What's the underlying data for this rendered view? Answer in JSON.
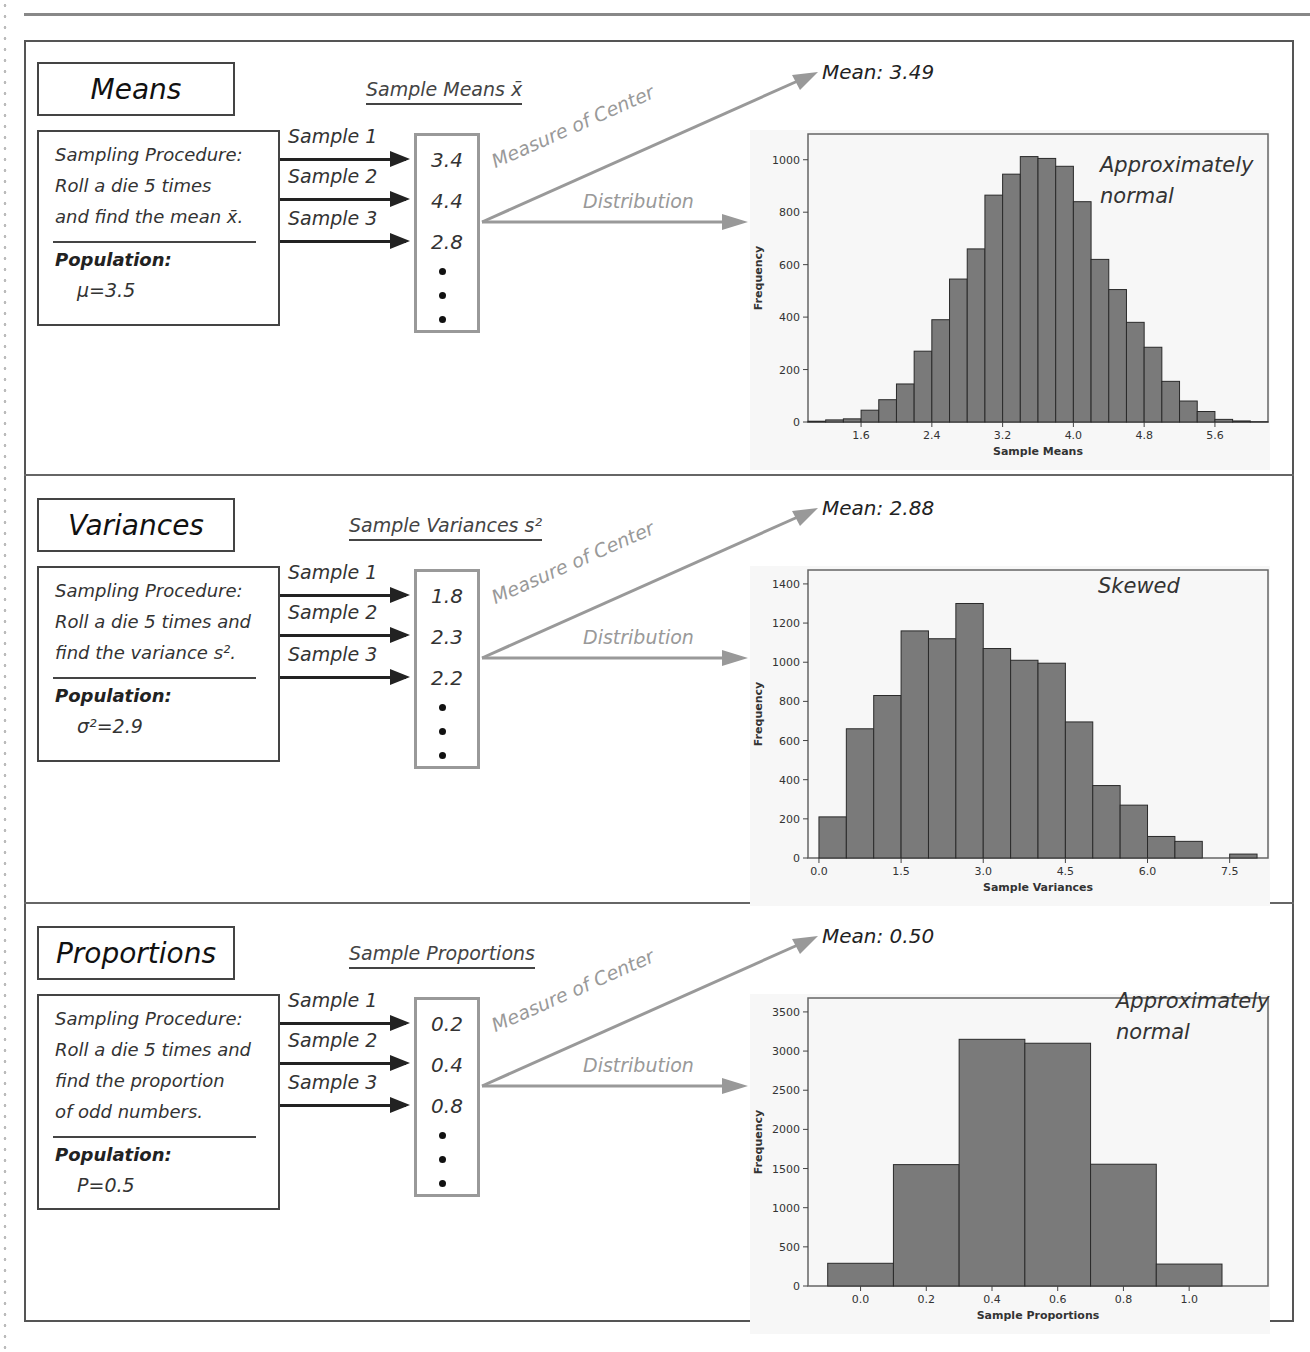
{
  "panels": [
    {
      "id": "means",
      "title": "Means",
      "procedure_lines": [
        "Sampling Procedure:",
        "Roll a die 5 times",
        "and find the mean x̄."
      ],
      "population_label": "Population:",
      "population_value": "μ=3.5",
      "samples": [
        "Sample 1",
        "Sample 2",
        "Sample 3"
      ],
      "column_header": "Sample Means x̄",
      "values": [
        "3.4",
        "4.4",
        "2.8"
      ],
      "measure_label": "Measure of Center",
      "distribution_label": "Distribution",
      "mean_label": "Mean: 3.49",
      "annotation": [
        "Approximately",
        "normal"
      ]
    },
    {
      "id": "variances",
      "title": "Variances",
      "procedure_lines": [
        "Sampling Procedure:",
        "Roll a die 5 times and",
        "find the variance s²."
      ],
      "population_label": "Population:",
      "population_value": "σ²=2.9",
      "samples": [
        "Sample 1",
        "Sample 2",
        "Sample 3"
      ],
      "column_header": "Sample Variances s²",
      "values": [
        "1.8",
        "2.3",
        "2.2"
      ],
      "measure_label": "Measure of Center",
      "distribution_label": "Distribution",
      "mean_label": "Mean: 2.88",
      "annotation": [
        "Skewed"
      ]
    },
    {
      "id": "proportions",
      "title": "Proportions",
      "procedure_lines": [
        "Sampling Procedure:",
        "Roll a die 5 times and",
        "find the proportion",
        "of odd numbers."
      ],
      "population_label": "Population:",
      "population_value": "P=0.5",
      "samples": [
        "Sample 1",
        "Sample 2",
        "Sample 3"
      ],
      "column_header": "Sample Proportions",
      "values": [
        "0.2",
        "0.4",
        "0.8"
      ],
      "measure_label": "Measure of Center",
      "distribution_label": "Distribution",
      "mean_label": "Mean: 0.50",
      "annotation": [
        "Approximately",
        "normal"
      ]
    }
  ],
  "colors": {
    "bar_fill": "#7a7a7a",
    "bar_stroke": "#2a2a2a",
    "grey_arrow": "#999999",
    "frame": "#555555"
  },
  "chart_data": [
    {
      "type": "bar",
      "title": "",
      "xlabel": "Sample Means",
      "ylabel": "Frequency",
      "bin_width": 0.2,
      "bin_start": 1.0,
      "x_ticks": [
        "1.6",
        "2.4",
        "3.2",
        "4.0",
        "4.8",
        "5.6"
      ],
      "y_ticks": [
        0,
        200,
        400,
        600,
        800,
        1000
      ],
      "ylim": [
        0,
        1060
      ],
      "values": [
        3,
        8,
        12,
        45,
        85,
        145,
        270,
        390,
        545,
        660,
        865,
        945,
        1012,
        1005,
        975,
        840,
        620,
        505,
        380,
        285,
        155,
        80,
        40,
        10,
        4,
        1
      ],
      "annotation": "Approximately normal"
    },
    {
      "type": "bar",
      "title": "",
      "xlabel": "Sample Variances",
      "ylabel": "Frequency",
      "bin_width": 0.5,
      "bin_start": 0.0,
      "x_ticks": [
        "0.0",
        "1.5",
        "3.0",
        "4.5",
        "6.0",
        "7.5"
      ],
      "y_ticks": [
        0,
        200,
        400,
        600,
        800,
        1000,
        1200,
        1400
      ],
      "ylim": [
        0,
        1420
      ],
      "values": [
        210,
        660,
        830,
        1160,
        1120,
        1300,
        1070,
        1010,
        995,
        695,
        370,
        270,
        110,
        85,
        0,
        20
      ],
      "annotation": "Skewed"
    },
    {
      "type": "bar",
      "title": "",
      "xlabel": "Sample Proportions",
      "ylabel": "Frequency",
      "categories": [
        "0.0",
        "0.2",
        "0.4",
        "0.6",
        "0.8",
        "1.0"
      ],
      "x_ticks": [
        "0.0",
        "0.2",
        "0.4",
        "0.6",
        "0.8",
        "1.0"
      ],
      "y_ticks": [
        0,
        500,
        1000,
        1500,
        2000,
        2500,
        3000,
        3500
      ],
      "ylim": [
        0,
        3550
      ],
      "values": [
        290,
        1550,
        3150,
        3100,
        1555,
        280
      ],
      "annotation": "Approximately normal"
    }
  ]
}
